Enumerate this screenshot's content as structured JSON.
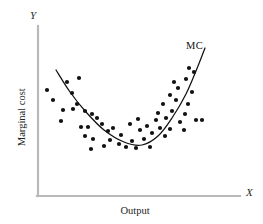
{
  "figure": {
    "background": "#ffffff",
    "width": 263,
    "height": 224
  },
  "axes": {
    "y_letter": "Y",
    "x_letter": "X",
    "y_title": "Marginal cost",
    "x_title": "Output",
    "axis_color": "#b9b9b9",
    "origin_px": [
      38,
      196
    ],
    "x_end_px": [
      240,
      196
    ],
    "y_end_px": [
      38,
      26
    ]
  },
  "chart_data": {
    "type": "scatter",
    "title": "",
    "xlabel": "Output",
    "ylabel": "Marginal cost",
    "axis_letters": {
      "x": "X",
      "y": "Y"
    },
    "grid": false,
    "legend": "none",
    "annotations": [
      {
        "text": "MC",
        "x_px": 195,
        "y_px": 46,
        "color": "#111111"
      }
    ],
    "marker": {
      "shape": "circle",
      "radius_px": 2.1,
      "color": "#111111"
    },
    "points_px": [
      [
        67,
        82
      ],
      [
        79,
        78
      ],
      [
        47,
        90
      ],
      [
        72,
        93
      ],
      [
        53,
        100
      ],
      [
        77,
        104
      ],
      [
        63,
        110
      ],
      [
        73,
        109
      ],
      [
        85,
        111
      ],
      [
        92,
        114
      ],
      [
        97,
        118
      ],
      [
        61,
        121
      ],
      [
        81,
        127
      ],
      [
        88,
        127
      ],
      [
        85,
        136
      ],
      [
        93,
        139
      ],
      [
        91,
        149
      ],
      [
        102,
        124
      ],
      [
        108,
        131
      ],
      [
        113,
        128
      ],
      [
        110,
        140
      ],
      [
        104,
        146
      ],
      [
        119,
        144
      ],
      [
        126,
        147
      ],
      [
        121,
        135
      ],
      [
        132,
        141
      ],
      [
        136,
        148
      ],
      [
        130,
        124
      ],
      [
        140,
        130
      ],
      [
        144,
        139
      ],
      [
        138,
        119
      ],
      [
        147,
        126
      ],
      [
        152,
        133
      ],
      [
        150,
        147
      ],
      [
        156,
        120
      ],
      [
        160,
        128
      ],
      [
        158,
        113
      ],
      [
        165,
        136
      ],
      [
        170,
        129
      ],
      [
        166,
        118
      ],
      [
        172,
        111
      ],
      [
        163,
        104
      ],
      [
        176,
        100
      ],
      [
        170,
        95
      ],
      [
        180,
        122
      ],
      [
        184,
        130
      ],
      [
        185,
        114
      ],
      [
        188,
        104
      ],
      [
        178,
        88
      ],
      [
        174,
        82
      ],
      [
        186,
        79
      ],
      [
        192,
        92
      ],
      [
        196,
        120
      ],
      [
        202,
        120
      ],
      [
        194,
        72
      ],
      [
        189,
        68
      ]
    ],
    "curve": {
      "name": "MC",
      "color": "#111111",
      "shape": "u-shaped quadratic",
      "path_px": [
        [
          56,
          70
        ],
        [
          70,
          92
        ],
        [
          86,
          112
        ],
        [
          104,
          130
        ],
        [
          124,
          142
        ],
        [
          142,
          145
        ],
        [
          158,
          136
        ],
        [
          172,
          118
        ],
        [
          186,
          94
        ],
        [
          198,
          66
        ],
        [
          205,
          48
        ]
      ]
    }
  }
}
